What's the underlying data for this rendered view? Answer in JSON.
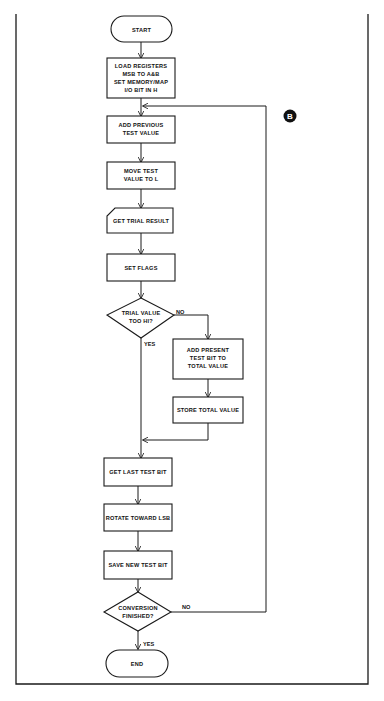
{
  "diagram": {
    "type": "flowchart",
    "marker": "B",
    "nodes": {
      "start": "START",
      "load_registers": [
        "LOAD REGISTERS",
        "MSB TO A&B",
        "SET MEMORY/MAP",
        "I/O BIT IN H"
      ],
      "add_previous": [
        "ADD PREVIOUS",
        "TEST VALUE"
      ],
      "move_test": [
        "MOVE TEST",
        "VALUE TO L"
      ],
      "get_trial": "GET TRIAL RESULT",
      "set_flags": "SET FLAGS",
      "trial_decision": [
        "TRIAL VALUE",
        "TOO HI?"
      ],
      "add_present": [
        "ADD PRESENT",
        "TEST BIT TO",
        "TOTAL VALUE"
      ],
      "store_total": "STORE TOTAL VALUE",
      "get_last": "GET LAST TEST BIT",
      "rotate": "ROTATE TOWARD LSB",
      "save_new": "SAVE NEW TEST BIT",
      "conversion_decision": [
        "CONVERSION",
        "FINISHED?"
      ],
      "end": "END"
    },
    "edge_labels": {
      "trial_no": "NO",
      "trial_yes": "YES",
      "conversion_no": "NO",
      "conversion_yes": "YES"
    }
  }
}
